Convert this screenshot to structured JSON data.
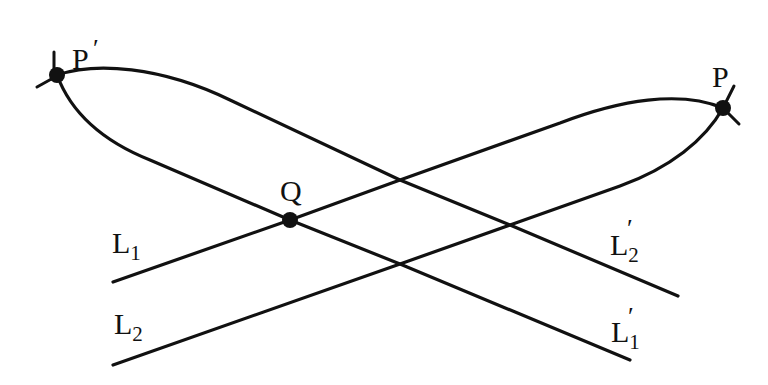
{
  "diagram": {
    "type": "geometric-curves",
    "stroke_color": "#111111",
    "background": "#ffffff",
    "points": [
      {
        "id": "P_prime",
        "label": "P",
        "prime": "′",
        "x": 57,
        "y": 75
      },
      {
        "id": "P",
        "label": "P",
        "x": 723,
        "y": 108
      },
      {
        "id": "Q",
        "label": "Q",
        "x": 290,
        "y": 220
      }
    ],
    "labels": {
      "p_prime": {
        "base": "P",
        "prime": "′"
      },
      "p": {
        "base": "P"
      },
      "q": {
        "base": "Q"
      },
      "l1": {
        "base": "L",
        "sub": "1"
      },
      "l2": {
        "base": "L",
        "sub": "2"
      },
      "l1_prime": {
        "base": "L",
        "sub": "1",
        "prime": "′"
      },
      "l2_prime": {
        "base": "L",
        "sub": "2",
        "prime": "′"
      }
    },
    "curves": [
      {
        "name": "L1",
        "from": "left end (113,282)",
        "through": [
          "Q",
          "(400,180)"
        ],
        "to": "P"
      },
      {
        "name": "L2",
        "from": "left end (113,365)",
        "through": [
          "(400,264)",
          "(510,225)"
        ],
        "to": "P"
      },
      {
        "name": "L2'",
        "from": "P'",
        "through": [
          "(400,180)",
          "(510,225)"
        ],
        "to": "right end (678,296)"
      },
      {
        "name": "L1'",
        "from": "P'",
        "through": [
          "Q",
          "(400,264)"
        ],
        "to": "right end (630,360)"
      }
    ]
  }
}
